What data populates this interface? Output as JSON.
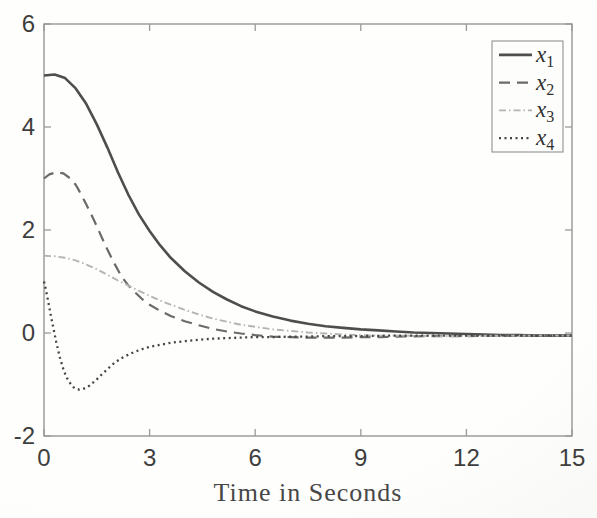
{
  "figure": {
    "axis_color": "#8e8e8e",
    "tick_color": "#9a9a9a",
    "tick_label_color": "#3e3e3e",
    "xlabel_color": "#474747",
    "legend_border_color": "#9a9a9a",
    "legend_bg": "#fdfdfc"
  },
  "chart_data": {
    "type": "line",
    "title": "",
    "xlabel": "Time in Seconds",
    "ylabel": "",
    "xlim": [
      0,
      15
    ],
    "ylim": [
      -2,
      6
    ],
    "x_ticks": [
      0,
      3,
      6,
      9,
      12,
      15
    ],
    "y_ticks": [
      -2,
      0,
      2,
      4,
      6
    ],
    "grid": false,
    "legend_position": "top-right",
    "series": [
      {
        "name": "x1",
        "legend_base": "x",
        "legend_sub": "1",
        "color": "#4e4e4e",
        "dash": "none",
        "width": 2.6,
        "points": [
          [
            0,
            5.0
          ],
          [
            0.3,
            5.02
          ],
          [
            0.6,
            4.95
          ],
          [
            0.9,
            4.75
          ],
          [
            1.2,
            4.45
          ],
          [
            1.5,
            4.05
          ],
          [
            1.8,
            3.6
          ],
          [
            2.1,
            3.12
          ],
          [
            2.4,
            2.68
          ],
          [
            2.7,
            2.3
          ],
          [
            3.0,
            1.98
          ],
          [
            3.3,
            1.7
          ],
          [
            3.6,
            1.46
          ],
          [
            4.0,
            1.2
          ],
          [
            4.4,
            0.98
          ],
          [
            4.8,
            0.8
          ],
          [
            5.2,
            0.65
          ],
          [
            5.6,
            0.52
          ],
          [
            6.0,
            0.42
          ],
          [
            6.5,
            0.32
          ],
          [
            7.0,
            0.24
          ],
          [
            7.5,
            0.18
          ],
          [
            8.0,
            0.13
          ],
          [
            8.5,
            0.1
          ],
          [
            9.0,
            0.07
          ],
          [
            9.5,
            0.05
          ],
          [
            10.0,
            0.03
          ],
          [
            10.5,
            0.01
          ],
          [
            11.0,
            0.0
          ],
          [
            11.5,
            -0.01
          ],
          [
            12.0,
            -0.02
          ],
          [
            12.5,
            -0.03
          ],
          [
            13.0,
            -0.04
          ],
          [
            13.5,
            -0.04
          ],
          [
            14.0,
            -0.05
          ],
          [
            14.5,
            -0.05
          ],
          [
            15.0,
            -0.05
          ]
        ]
      },
      {
        "name": "x2",
        "legend_base": "x",
        "legend_sub": "2",
        "color": "#6a6a6a",
        "dash": "11 7",
        "width": 2.2,
        "points": [
          [
            0,
            3.0
          ],
          [
            0.15,
            3.08
          ],
          [
            0.35,
            3.12
          ],
          [
            0.55,
            3.1
          ],
          [
            0.75,
            3.0
          ],
          [
            0.9,
            2.88
          ],
          [
            1.0,
            2.76
          ],
          [
            1.2,
            2.5
          ],
          [
            1.4,
            2.22
          ],
          [
            1.6,
            1.92
          ],
          [
            1.8,
            1.62
          ],
          [
            2.0,
            1.35
          ],
          [
            2.2,
            1.1
          ],
          [
            2.4,
            0.92
          ],
          [
            2.6,
            0.78
          ],
          [
            2.8,
            0.65
          ],
          [
            3.0,
            0.55
          ],
          [
            3.3,
            0.43
          ],
          [
            3.6,
            0.33
          ],
          [
            4.0,
            0.23
          ],
          [
            4.4,
            0.15
          ],
          [
            4.8,
            0.08
          ],
          [
            5.2,
            0.03
          ],
          [
            5.6,
            -0.01
          ],
          [
            6.0,
            -0.04
          ],
          [
            6.5,
            -0.07
          ],
          [
            7.0,
            -0.08
          ],
          [
            7.5,
            -0.09
          ],
          [
            8.0,
            -0.09
          ],
          [
            8.5,
            -0.09
          ],
          [
            9.0,
            -0.08
          ],
          [
            9.5,
            -0.08
          ],
          [
            10.0,
            -0.07
          ],
          [
            11.0,
            -0.06
          ],
          [
            12.0,
            -0.06
          ],
          [
            13.0,
            -0.05
          ],
          [
            14.0,
            -0.05
          ],
          [
            15.0,
            -0.05
          ]
        ]
      },
      {
        "name": "x3",
        "legend_base": "x",
        "legend_sub": "3",
        "color": "#b4b4b4",
        "dash": "7 3 1.5 3",
        "width": 1.9,
        "points": [
          [
            0,
            1.5
          ],
          [
            0.3,
            1.49
          ],
          [
            0.6,
            1.46
          ],
          [
            0.9,
            1.41
          ],
          [
            1.2,
            1.33
          ],
          [
            1.5,
            1.24
          ],
          [
            1.8,
            1.13
          ],
          [
            2.1,
            1.02
          ],
          [
            2.4,
            0.92
          ],
          [
            2.7,
            0.82
          ],
          [
            3.0,
            0.72
          ],
          [
            3.3,
            0.63
          ],
          [
            3.6,
            0.55
          ],
          [
            4.0,
            0.45
          ],
          [
            4.4,
            0.36
          ],
          [
            4.8,
            0.28
          ],
          [
            5.2,
            0.22
          ],
          [
            5.6,
            0.16
          ],
          [
            6.0,
            0.12
          ],
          [
            6.5,
            0.07
          ],
          [
            7.0,
            0.04
          ],
          [
            7.5,
            0.01
          ],
          [
            8.0,
            -0.01
          ],
          [
            8.5,
            -0.03
          ],
          [
            9.0,
            -0.04
          ],
          [
            9.5,
            -0.05
          ],
          [
            10.0,
            -0.05
          ],
          [
            11.0,
            -0.06
          ],
          [
            12.0,
            -0.06
          ],
          [
            13.0,
            -0.05
          ],
          [
            14.0,
            -0.05
          ],
          [
            15.0,
            -0.05
          ]
        ]
      },
      {
        "name": "x4",
        "legend_base": "x",
        "legend_sub": "4",
        "color": "#454545",
        "dash": "2 3.5",
        "width": 2.3,
        "points": [
          [
            0,
            1.0
          ],
          [
            0.05,
            0.85
          ],
          [
            0.1,
            0.68
          ],
          [
            0.15,
            0.5
          ],
          [
            0.2,
            0.32
          ],
          [
            0.25,
            0.15
          ],
          [
            0.3,
            -0.02
          ],
          [
            0.35,
            -0.18
          ],
          [
            0.4,
            -0.33
          ],
          [
            0.45,
            -0.47
          ],
          [
            0.5,
            -0.59
          ],
          [
            0.55,
            -0.7
          ],
          [
            0.6,
            -0.79
          ],
          [
            0.65,
            -0.87
          ],
          [
            0.7,
            -0.93
          ],
          [
            0.75,
            -0.98
          ],
          [
            0.8,
            -1.03
          ],
          [
            0.85,
            -1.06
          ],
          [
            0.9,
            -1.08
          ],
          [
            1.0,
            -1.1
          ],
          [
            1.1,
            -1.09
          ],
          [
            1.2,
            -1.06
          ],
          [
            1.3,
            -1.02
          ],
          [
            1.4,
            -0.96
          ],
          [
            1.5,
            -0.9
          ],
          [
            1.6,
            -0.83
          ],
          [
            1.7,
            -0.77
          ],
          [
            1.8,
            -0.7
          ],
          [
            1.9,
            -0.64
          ],
          [
            2.0,
            -0.58
          ],
          [
            2.2,
            -0.49
          ],
          [
            2.4,
            -0.42
          ],
          [
            2.6,
            -0.36
          ],
          [
            2.8,
            -0.31
          ],
          [
            3.0,
            -0.27
          ],
          [
            3.3,
            -0.23
          ],
          [
            3.6,
            -0.19
          ],
          [
            4.0,
            -0.16
          ],
          [
            4.4,
            -0.13
          ],
          [
            4.8,
            -0.11
          ],
          [
            5.2,
            -0.1
          ],
          [
            5.6,
            -0.09
          ],
          [
            6.0,
            -0.08
          ],
          [
            6.5,
            -0.08
          ],
          [
            7.0,
            -0.07
          ],
          [
            7.5,
            -0.07
          ],
          [
            8.0,
            -0.06
          ],
          [
            9.0,
            -0.06
          ],
          [
            10.0,
            -0.05
          ],
          [
            11.0,
            -0.05
          ],
          [
            12.0,
            -0.05
          ],
          [
            13.0,
            -0.05
          ],
          [
            14.0,
            -0.05
          ],
          [
            15.0,
            -0.05
          ]
        ]
      }
    ]
  }
}
